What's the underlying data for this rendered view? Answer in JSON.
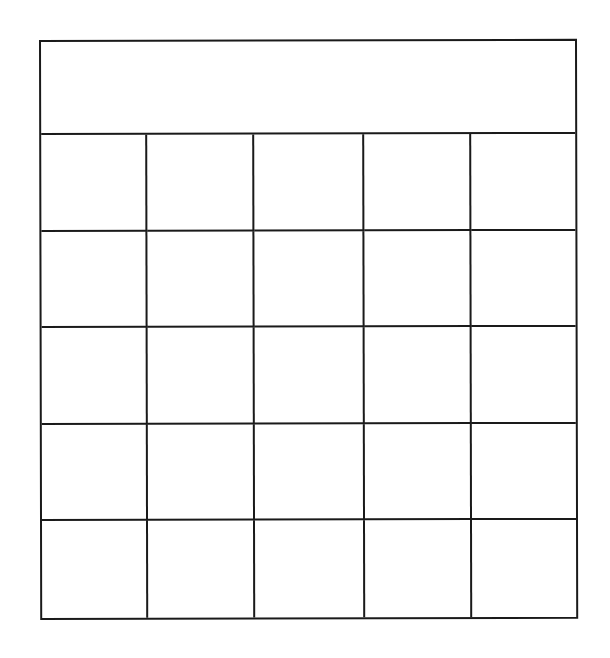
{
  "card": {
    "header": {
      "text": ""
    },
    "grid": {
      "rows": 5,
      "columns": 5,
      "cells": [
        [
          "",
          "",
          "",
          "",
          ""
        ],
        [
          "",
          "",
          "",
          "",
          ""
        ],
        [
          "",
          "",
          "",
          "",
          ""
        ],
        [
          "",
          "",
          "",
          "",
          ""
        ],
        [
          "",
          "",
          "",
          "",
          ""
        ]
      ]
    },
    "line_color": "#1a1a1a",
    "background_color": "#ffffff"
  }
}
